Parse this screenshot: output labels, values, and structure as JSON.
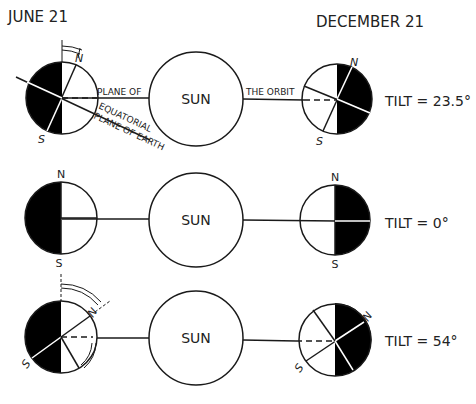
{
  "headers": {
    "left": "JUNE 21",
    "right": "DECEMBER 21"
  },
  "sun_label": "SUN",
  "labels": {
    "plane_of": "PLANE OF",
    "the_orbit": "THE ORBIT",
    "equatorial": "EQUATORIAL",
    "plane_of_earth": "PLANE OF EARTH",
    "north": "N",
    "south": "S"
  },
  "rows": [
    {
      "tilt_label": "TILT = 23.5°",
      "tilt_deg": 23.5
    },
    {
      "tilt_label": "TILT = 0°",
      "tilt_deg": 0
    },
    {
      "tilt_label": "TILT = 54°",
      "tilt_deg": 54
    }
  ],
  "colors": {
    "stroke": "#1a1a1a",
    "night": "#000000",
    "day": "#ffffff"
  }
}
